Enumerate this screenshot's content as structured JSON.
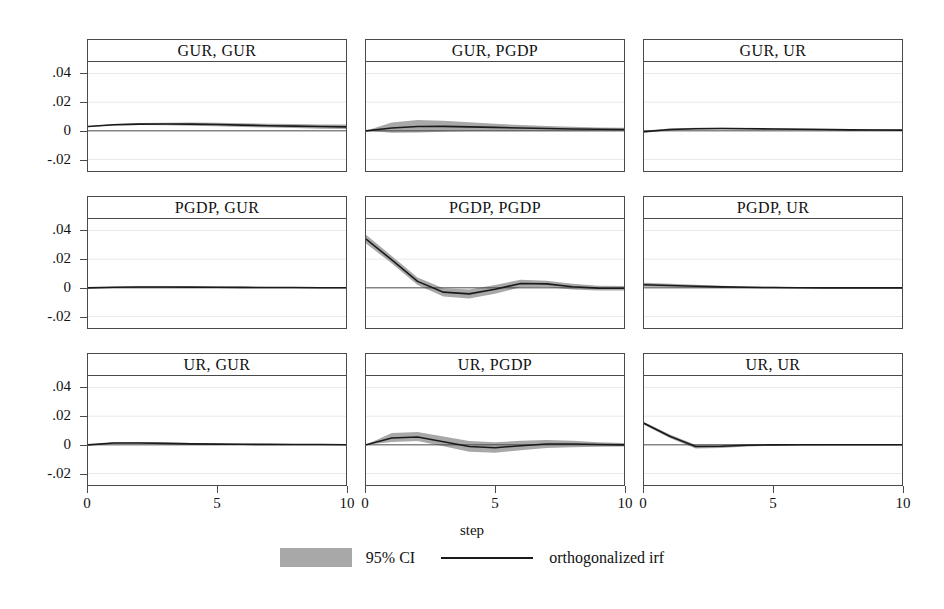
{
  "figure": {
    "xlabel": "step",
    "legend": {
      "ci_label": "95% CI",
      "irf_label": "orthogonalized irf",
      "ci_color": "#a8a8a8",
      "irf_color": "#1a1a1a"
    },
    "y_ticks": [
      ".04",
      ".02",
      "0",
      "-.02"
    ],
    "y_tick_values": [
      0.04,
      0.02,
      0,
      -0.02
    ],
    "x_ticks": [
      "0",
      "5",
      "10"
    ],
    "x_tick_values": [
      0,
      5,
      10
    ],
    "ylim": [
      -0.028,
      0.048
    ],
    "xlim": [
      0,
      10
    ]
  },
  "chart_data": {
    "type": "line",
    "title": "",
    "xlabel": "step",
    "ylabel": "",
    "xlim": [
      0,
      10
    ],
    "ylim": [
      -0.028,
      0.048
    ],
    "grid": false,
    "legend": [
      "95% CI",
      "orthogonalized irf"
    ],
    "legend_position": "bottom-center",
    "layout": {
      "rows": 3,
      "cols": 3
    },
    "x": [
      0,
      1,
      2,
      3,
      4,
      5,
      6,
      7,
      8,
      9,
      10
    ],
    "panels": [
      {
        "title": "GUR, GUR",
        "row": 0,
        "col": 0,
        "irf": [
          0.003,
          0.0042,
          0.0047,
          0.0048,
          0.0047,
          0.0044,
          0.004,
          0.0036,
          0.0033,
          0.003,
          0.0028
        ],
        "ci_lo": [
          0.0028,
          0.0037,
          0.004,
          0.0039,
          0.0036,
          0.0032,
          0.0027,
          0.0023,
          0.0019,
          0.0015,
          0.0012
        ],
        "ci_hi": [
          0.0032,
          0.0047,
          0.0054,
          0.0057,
          0.0058,
          0.0056,
          0.0053,
          0.0049,
          0.0047,
          0.0045,
          0.0044
        ]
      },
      {
        "title": "GUR, PGDP",
        "row": 0,
        "col": 1,
        "irf": [
          0.0,
          0.002,
          0.003,
          0.0031,
          0.0028,
          0.0024,
          0.002,
          0.0016,
          0.0013,
          0.0011,
          0.0009
        ],
        "ci_lo": [
          0.0,
          -0.0014,
          -0.0012,
          -0.0006,
          -0.0003,
          -0.0002,
          -0.0002,
          -0.0002,
          -0.0002,
          -0.0002,
          -0.0002
        ],
        "ci_hi": [
          0.0,
          0.0058,
          0.0075,
          0.0071,
          0.006,
          0.0049,
          0.0041,
          0.0034,
          0.0028,
          0.0024,
          0.0021
        ]
      },
      {
        "title": "GUR, UR",
        "row": 0,
        "col": 2,
        "irf": [
          -0.0006,
          0.0009,
          0.0015,
          0.0016,
          0.0015,
          0.0013,
          0.0011,
          0.0009,
          0.0007,
          0.0006,
          0.0005
        ],
        "ci_lo": [
          -0.0014,
          0.0003,
          0.001,
          0.0011,
          0.001,
          0.0008,
          0.0006,
          0.0004,
          0.0002,
          0.0001,
          0.0
        ],
        "ci_hi": [
          0.0002,
          0.0016,
          0.0021,
          0.0022,
          0.0021,
          0.0019,
          0.0017,
          0.0015,
          0.0013,
          0.0012,
          0.0011
        ]
      },
      {
        "title": "PGDP, GUR",
        "row": 1,
        "col": 0,
        "irf": [
          0.0,
          0.0004,
          0.0006,
          0.0006,
          0.0005,
          0.0004,
          0.0003,
          0.0002,
          0.0002,
          0.0001,
          0.0001
        ],
        "ci_lo": [
          0.0,
          0.0,
          0.0001,
          0.0001,
          0.0,
          0.0,
          -0.0001,
          -0.0001,
          -0.0001,
          -0.0001,
          -0.0001
        ],
        "ci_hi": [
          0.0,
          0.0008,
          0.0011,
          0.0011,
          0.001,
          0.0009,
          0.0008,
          0.0006,
          0.0005,
          0.0004,
          0.0004
        ]
      },
      {
        "title": "PGDP, PGDP",
        "row": 1,
        "col": 1,
        "irf": [
          0.034,
          0.0195,
          0.0045,
          -0.003,
          -0.0042,
          -0.001,
          0.003,
          0.0028,
          0.0008,
          -0.0002,
          -0.0003
        ],
        "ci_lo": [
          0.031,
          0.017,
          0.002,
          -0.006,
          -0.0075,
          -0.0042,
          0.0005,
          0.0006,
          -0.0012,
          -0.0018,
          -0.0018
        ],
        "ci_hi": [
          0.037,
          0.0222,
          0.0072,
          -0.0002,
          -0.0012,
          0.002,
          0.0056,
          0.005,
          0.0028,
          0.0014,
          0.0012
        ]
      },
      {
        "title": "PGDP, UR",
        "row": 1,
        "col": 2,
        "irf": [
          0.0022,
          0.0016,
          0.0011,
          0.0007,
          0.0004,
          0.0002,
          0.0001,
          0.0,
          0.0,
          0.0,
          0.0
        ],
        "ci_lo": [
          0.0008,
          0.0004,
          0.0001,
          -0.0001,
          -0.0002,
          -0.0003,
          -0.0003,
          -0.0003,
          -0.0003,
          -0.0003,
          -0.0003
        ],
        "ci_hi": [
          0.0036,
          0.0029,
          0.0021,
          0.0015,
          0.001,
          0.0007,
          0.0005,
          0.0003,
          0.0003,
          0.0003,
          0.0003
        ]
      },
      {
        "title": "UR, GUR",
        "row": 2,
        "col": 0,
        "irf": [
          0.0,
          0.0013,
          0.0013,
          0.001,
          0.0007,
          0.0005,
          0.0004,
          0.0003,
          0.0002,
          0.0002,
          0.0001
        ],
        "ci_lo": [
          0.0,
          0.0008,
          0.0008,
          0.0005,
          0.0002,
          0.0001,
          0.0,
          0.0,
          -0.0001,
          -0.0001,
          -0.0001
        ],
        "ci_hi": [
          0.0,
          0.0018,
          0.0019,
          0.0016,
          0.0013,
          0.001,
          0.0008,
          0.0006,
          0.0005,
          0.0005,
          0.0004
        ]
      },
      {
        "title": "UR, PGDP",
        "row": 2,
        "col": 1,
        "irf": [
          0.0,
          0.0048,
          0.0055,
          0.0022,
          -0.0012,
          -0.002,
          -0.0006,
          0.0006,
          0.0006,
          0.0002,
          0.0
        ],
        "ci_lo": [
          0.0,
          0.002,
          0.0026,
          -0.001,
          -0.0048,
          -0.0055,
          -0.0038,
          -0.0022,
          -0.0016,
          -0.0014,
          -0.0012
        ],
        "ci_hi": [
          0.0,
          0.0082,
          0.009,
          0.0058,
          0.0026,
          0.0018,
          0.0028,
          0.0034,
          0.0028,
          0.0018,
          0.0012
        ]
      },
      {
        "title": "UR, UR",
        "row": 2,
        "col": 2,
        "irf": [
          0.015,
          0.006,
          -0.0012,
          -0.001,
          -0.0003,
          0.0,
          0.0001,
          0.0001,
          0.0001,
          0.0001,
          0.0001
        ],
        "ci_lo": [
          0.014,
          0.0048,
          -0.0025,
          -0.0022,
          -0.0012,
          -0.0006,
          -0.0004,
          -0.0003,
          -0.0002,
          -0.0002,
          -0.0002
        ],
        "ci_hi": [
          0.016,
          0.0072,
          0.0001,
          0.0002,
          0.0006,
          0.0006,
          0.0006,
          0.0005,
          0.0004,
          0.0004,
          0.0004
        ]
      }
    ]
  }
}
